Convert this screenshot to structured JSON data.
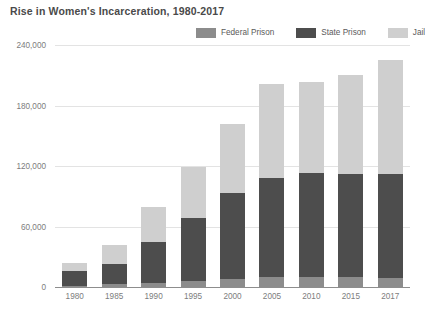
{
  "chart_data": {
    "type": "bar",
    "subtype": "stacked-bar",
    "title": "Rise in Women's Incarceration, 1980-2017",
    "xlabel": "",
    "ylabel": "",
    "categories": [
      "1980",
      "1985",
      "1990",
      "1995",
      "2000",
      "2005",
      "2010",
      "2015",
      "2017"
    ],
    "series": [
      {
        "name": "Federal Prison",
        "color": "#8c8c8c",
        "values": [
          1500,
          2500,
          4000,
          6000,
          8000,
          9500,
          9500,
          9500,
          9000
        ]
      },
      {
        "name": "State Prison",
        "color": "#4d4d4d",
        "values": [
          14500,
          20500,
          41000,
          62000,
          85000,
          98500,
          103500,
          102500,
          103000
        ]
      },
      {
        "name": "Jail",
        "color": "#cfcfcf",
        "values": [
          8000,
          19000,
          34000,
          51000,
          69000,
          93000,
          90000,
          98000,
          113000
        ]
      }
    ],
    "totals": [
      24000,
      42000,
      79000,
      119000,
      162000,
      201000,
      203000,
      210000,
      225000
    ],
    "ylim": [
      0,
      240000
    ],
    "y_ticks": [
      0,
      60000,
      120000,
      180000,
      240000
    ],
    "y_tick_labels": [
      "0",
      "60,000",
      "120,000",
      "180,000",
      "240,000"
    ],
    "grid": true,
    "legend_position": "top-right",
    "stack_order_bottom_to_top": [
      "Federal Prison",
      "State Prison",
      "Jail"
    ]
  },
  "legend": {
    "items": [
      {
        "label": "Federal Prison",
        "color": "#8c8c8c"
      },
      {
        "label": "State Prison",
        "color": "#4d4d4d"
      },
      {
        "label": "Jail",
        "color": "#cfcfcf"
      }
    ]
  },
  "colors": {
    "federal_prison": "#8c8c8c",
    "state_prison": "#4d4d4d",
    "jail": "#cfcfcf",
    "gridline": "#e3e3e3",
    "axis": "#8d8d8d",
    "title_text": "#4a4a4a",
    "tick_text": "#7d7d7d",
    "background": "#ffffff"
  }
}
